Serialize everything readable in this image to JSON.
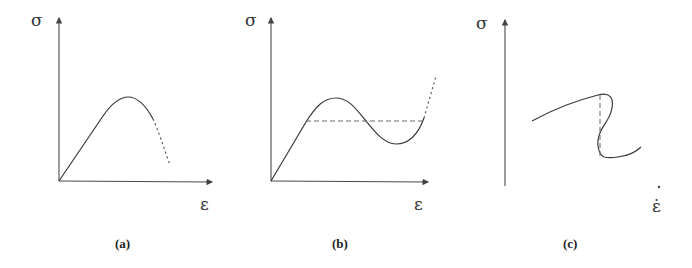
{
  "figure": {
    "panels": [
      {
        "label": "(a)",
        "y_axis_label": "σ",
        "x_axis_label": "ε",
        "description": "Stress-strain curve rising linearly, reaching a peak, then softening (dotted continuation)"
      },
      {
        "label": "(b)",
        "y_axis_label": "σ",
        "x_axis_label": "ε",
        "description": "Non-monotonic stress-strain curve with peak and valley; dashed horizontal Maxwell line; dotted rising continuation"
      },
      {
        "label": "(c)",
        "y_axis_label": "σ",
        "x_axis_label": "ε̇",
        "description": "S-shaped (multivalued) curve with vertical dashed jump line"
      }
    ]
  }
}
